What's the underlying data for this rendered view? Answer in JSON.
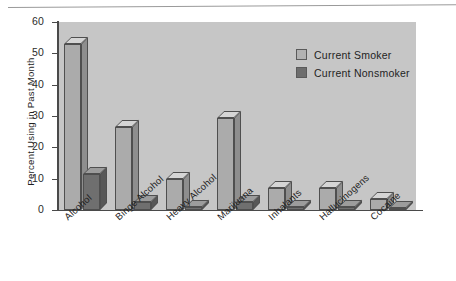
{
  "chart_data": {
    "type": "bar",
    "title": "",
    "subtitle": "",
    "xlabel": "",
    "ylabel": "Percent Using in Past Month",
    "ylim": [
      0,
      60
    ],
    "yticks": [
      0,
      10,
      20,
      30,
      40,
      50,
      60
    ],
    "ytick_labels": [
      "0",
      "10",
      "20",
      "30",
      "40",
      "50",
      "60"
    ],
    "grid": false,
    "legend_position": "top-right",
    "categories": [
      "Alcohol",
      "Binge Alcohol",
      "Heavy Alcohol",
      "Marijuana",
      "Inhalants",
      "Hallucinogens",
      "Cocaine"
    ],
    "series": [
      {
        "name": "Current Smoker",
        "color": "#b2b2b2",
        "values": [
          53,
          26.5,
          10,
          29.5,
          7,
          7,
          3.5
        ]
      },
      {
        "name": "Current Nonsmoker",
        "color": "#6d6d6d",
        "values": [
          11.5,
          2.5,
          1,
          2.5,
          1,
          1,
          0.5
        ]
      }
    ],
    "annotations": []
  },
  "legend": {
    "items": [
      {
        "label": "Current Smoker"
      },
      {
        "label": "Current Nonsmoker"
      }
    ]
  },
  "colors": {
    "plot_background": "#c6c6c6",
    "page_background": "#ffffff",
    "axis": "#4a4a4a",
    "smoker": "#b2b2b2",
    "nonsmoker": "#6d6d6d"
  }
}
